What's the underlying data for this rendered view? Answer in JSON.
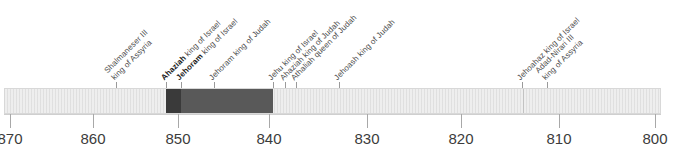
{
  "figure": {
    "orientation": "horizontal",
    "era_note": "BC dates decreasing left to right"
  },
  "axis": {
    "label": "",
    "ticks": [
      {
        "value": "870",
        "x": 10
      },
      {
        "value": "860",
        "x": 93
      },
      {
        "value": "850",
        "x": 178
      },
      {
        "value": "840",
        "x": 269
      },
      {
        "value": "830",
        "x": 367
      },
      {
        "value": "820",
        "x": 461
      },
      {
        "value": "810",
        "x": 559
      },
      {
        "value": "800",
        "x": 655
      }
    ]
  },
  "band": {
    "track_color": "#eeeeee",
    "border_color": "#d8d8d8",
    "segments": [
      {
        "name": "ahaziah-israel-reign",
        "left": 165,
        "width": 15,
        "color": "#3a3a3a"
      },
      {
        "name": "jehoram-israel-reign",
        "left": 180,
        "width": 92,
        "color": "#595959"
      }
    ],
    "dividers": [
      {
        "name": "divider-812",
        "left": 522
      }
    ]
  },
  "events": [
    {
      "id": "shalmaneser-iii",
      "x": 116,
      "bold": "",
      "lines": [
        "Shalmaneser III",
        "king of Assyria"
      ]
    },
    {
      "id": "ahaziah-israel",
      "x": 166,
      "bold": "Ahaziah",
      "lines": [
        "Ahaziah king of Israel"
      ]
    },
    {
      "id": "jehoram-israel",
      "x": 181,
      "bold": "Jehoram",
      "lines": [
        "Jehoram king of Israel"
      ]
    },
    {
      "id": "jehoram-judah",
      "x": 214,
      "bold": "",
      "lines": [
        "Jehoram king of Judah"
      ]
    },
    {
      "id": "jehu-israel",
      "x": 273,
      "bold": "",
      "lines": [
        "Jehu king of Israel"
      ]
    },
    {
      "id": "ahaziah-judah",
      "x": 285,
      "bold": "",
      "lines": [
        "Ahaziah king of Judah"
      ]
    },
    {
      "id": "athaliah-judah",
      "x": 296,
      "bold": "",
      "lines": [
        "Athaliah queen of Judah"
      ]
    },
    {
      "id": "jehoash-judah",
      "x": 339,
      "bold": "",
      "lines": [
        "Jehoash king of Judah"
      ]
    },
    {
      "id": "jehoahaz-israel",
      "x": 522,
      "bold": "",
      "lines": [
        "Jehoahaz king of Israel"
      ]
    },
    {
      "id": "adad-nirari-iii",
      "x": 547,
      "bold": "",
      "lines": [
        "Adad-Nirari III",
        "king of Assyria"
      ]
    }
  ]
}
